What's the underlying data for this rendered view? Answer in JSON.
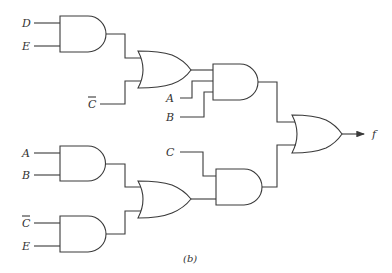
{
  "diagram": {
    "type": "logic-circuit",
    "caption": "(b)",
    "output_label": "f",
    "inputs": {
      "and1_a": "D",
      "and1_b": "E",
      "or1_c": "C",
      "and2_a": "A",
      "and2_b": "B",
      "and3_a": "A",
      "and3_b": "B",
      "and4_a": "C",
      "and4_b": "E",
      "and5_c": "C"
    },
    "negated_inputs": [
      "or1_c",
      "and4_a"
    ],
    "gates": [
      {
        "id": "and1",
        "type": "AND",
        "inputs": [
          "D",
          "E"
        ]
      },
      {
        "id": "or1",
        "type": "OR",
        "inputs": [
          "and1",
          "C'"
        ]
      },
      {
        "id": "and2",
        "type": "AND",
        "inputs": [
          "or1",
          "A",
          "B"
        ]
      },
      {
        "id": "and3",
        "type": "AND",
        "inputs": [
          "A",
          "B"
        ]
      },
      {
        "id": "and4",
        "type": "AND",
        "inputs": [
          "C'",
          "E"
        ]
      },
      {
        "id": "or2",
        "type": "OR",
        "inputs": [
          "and3",
          "and4"
        ]
      },
      {
        "id": "and5",
        "type": "AND",
        "inputs": [
          "C",
          "or2"
        ]
      },
      {
        "id": "or3",
        "type": "OR",
        "inputs": [
          "and2",
          "and5"
        ],
        "output": "f"
      }
    ]
  }
}
